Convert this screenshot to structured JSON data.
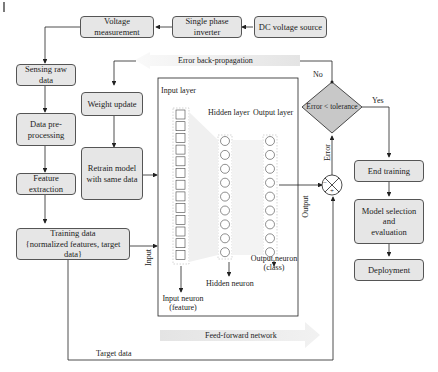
{
  "diagram": {
    "top_row": {
      "voltage_measurement": "Voltage measurement",
      "single_phase_inverter": "Single phase inverter",
      "dc_voltage_source": "DC voltage source"
    },
    "left_column": {
      "sensing_raw_data": "Sensing raw data",
      "data_preprocessing_1": "Data pre-",
      "data_preprocessing_2": "processing",
      "feature_extraction": "Feature extraction",
      "training_data_1": "Training data",
      "training_data_2": "{normalized features, target data}"
    },
    "middle_column": {
      "weight_update": "Weight update",
      "retrain_1": "Retrain model",
      "retrain_2": "with same data"
    },
    "network": {
      "input_layer": "Input layer",
      "hidden_layer": "Hidden layer",
      "output_layer": "Output layer",
      "input_neuron_1": "Input neuron",
      "input_neuron_2": "(feature)",
      "hidden_neuron": "Hidden neuron",
      "output_neuron_1": "Output neuron",
      "output_neuron_2": "(class)",
      "input_count": 13,
      "hidden_count": 9,
      "output_count": 9
    },
    "arrows": {
      "error_backprop": "Error back-propagation",
      "feed_forward": "Feed-forward network",
      "input": "Input",
      "output": "Output",
      "error": "Error",
      "target_data": "Target data",
      "no": "No",
      "yes": "Yes"
    },
    "decision": {
      "label": "Error < tolerance"
    },
    "right_column": {
      "end_training": "End training",
      "model_selection_1": "Model selection",
      "model_selection_2": "and",
      "model_selection_3": "evaluation",
      "deployment": "Deployment"
    },
    "sum_junction": {
      "minus": "−",
      "plus": "+"
    }
  }
}
